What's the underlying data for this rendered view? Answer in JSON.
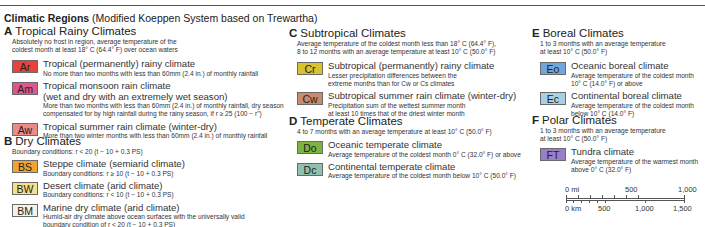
{
  "title": {
    "bold": "Climatic Regions",
    "rest": " (Modified Koeppen System based on Trewartha)"
  },
  "groups": [
    {
      "letter": "A",
      "name": "Tropical Rainy Climates",
      "desc": [
        "Absolutely no frost in region, average temperature of the",
        "coldest month at least 18° C (64.4° F) over ocean waters"
      ],
      "items": [
        {
          "code": "Ar",
          "color": "#e8433a",
          "name": [
            "Tropical (permanently) rainy climate"
          ],
          "desc": [
            "No more than two months with less than 60mm (2.4 in.) of monthly rainfall"
          ]
        },
        {
          "code": "Am",
          "color": "#e2558b",
          "name": [
            "Tropical monsoon rain climate",
            "(wet and dry with an extremely wet season)"
          ],
          "desc": [
            "More than two months with less than 60mm (2.4 in.) of monthly rainfall, dry season",
            "compensated for by high rainfall during the rainy season, if r ≥ 25 (100 − r\")"
          ]
        },
        {
          "code": "Aw",
          "color": "#ec8a86",
          "name": [
            "Tropical summer rain climate (winter-dry)"
          ],
          "desc": [
            "More than two winter months with less than 60mm (2.4 in.) of monthly rainfall"
          ]
        }
      ]
    },
    {
      "letter": "B",
      "name": "Dry Climates",
      "desc": [
        "Boundary conditions: r < 20 (t − 10 + 0.3 PS)"
      ],
      "items": [
        {
          "code": "BS",
          "color": "#f0a432",
          "name": [
            "Steppe climate (semiarid climate)"
          ],
          "desc": [
            "Boundary conditions: r ≥ 10 (t − 10 + 0.3 PS)"
          ]
        },
        {
          "code": "BW",
          "color": "#f7e08a",
          "name": [
            "Desert climate (arid climate)"
          ],
          "desc": [
            "Boundary conditions: r < 10 (t − 10 + 0.3 PS)"
          ]
        },
        {
          "code": "BM",
          "color": "#f6f2e4",
          "name": [
            "Marine dry climate (arid climate)"
          ],
          "desc": [
            "Humid-air dry climate above ocean surfaces with the universally valid",
            "boundary condition of r < 20 (t − 10 + 0.3 PS)"
          ]
        }
      ]
    },
    {
      "letter": "C",
      "name": "Subtropical Climates",
      "desc": [
        "Average temperature of the coldest month less than 18° C (64.4° F),",
        "8 to 12 months with an average temperature at least 10° C (50.0° F)"
      ],
      "items": [
        {
          "code": "Cr",
          "color": "#d8c22e",
          "name": [
            "Subtropical (permanently) rainy climate"
          ],
          "desc": [
            "Lesser precipitation differences between the",
            "extreme months than for Cw or Cs climates"
          ]
        },
        {
          "code": "Cw",
          "color": "#c98a6e",
          "name": [
            "Subtropical summer rain climate (winter-dry)"
          ],
          "desc": [
            "Precipitation sum of the wettest summer month",
            "at least 10 times that of the driest winter month"
          ]
        }
      ]
    },
    {
      "letter": "D",
      "name": "Temperate Climates",
      "desc": [
        "4 to 7 months with an average temperature at least 10° C (50.0° F)"
      ],
      "items": [
        {
          "code": "Do",
          "color": "#7cb341",
          "name": [
            "Oceanic temperate climate"
          ],
          "desc": [
            "Average temperature of the coldest month 0° C (32.0° F) or above"
          ]
        },
        {
          "code": "Dc",
          "color": "#8fc1ae",
          "name": [
            "Continental temperate climate"
          ],
          "desc": [
            "Average temperature of the coldest month below 10° C (50.0° F)"
          ]
        }
      ]
    },
    {
      "letter": "E",
      "name": "Boreal Climates",
      "desc": [
        "1 to 3 months with an average temperature",
        "at least 10° C (50.0° F)"
      ],
      "items": [
        {
          "code": "Eo",
          "color": "#6fa7dc",
          "name": [
            "Oceanic boreal climate"
          ],
          "desc": [
            "Average temperature of the coldest month",
            "10° C (14.0° F) or above"
          ]
        },
        {
          "code": "Ec",
          "color": "#a9cfe3",
          "name": [
            "Continental boreal climate"
          ],
          "desc": [
            "Average temperature of the coldest month",
            "below  10° C (14.0° F)"
          ]
        }
      ]
    },
    {
      "letter": "F",
      "name": "Polar Climates",
      "desc": [
        "1 to 3 months with an average temperature",
        "at least 10° C (50.0° F)"
      ],
      "items": [
        {
          "code": "FT",
          "color": "#9b7fc6",
          "name": [
            "Tundra climate"
          ],
          "desc": [
            "Average temperature of the warmest month",
            "above 0° C (32.0° F)"
          ]
        }
      ]
    }
  ],
  "scale_bar": {
    "miles": {
      "unit_label": "0 mi",
      "labels": [
        "500",
        "1,000"
      ]
    },
    "km": {
      "unit_label": "0 km",
      "labels": [
        "500",
        "1,000",
        "1,500"
      ]
    }
  }
}
